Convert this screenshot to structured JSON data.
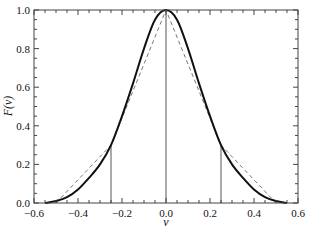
{
  "chart_data": {
    "type": "line",
    "title": "",
    "xlabel": "v",
    "ylabel": "F(v)",
    "xlim": [
      -0.6,
      0.6
    ],
    "ylim": [
      0.0,
      1.0
    ],
    "xticks": [
      -0.6,
      -0.4,
      -0.2,
      0.0,
      0.2,
      0.4,
      0.6
    ],
    "xtick_labels": [
      "−0.6",
      "−0.4",
      "−0.2",
      "0.0",
      "0.2",
      "0.4",
      "0.6"
    ],
    "yticks": [
      0.0,
      0.2,
      0.4,
      0.6,
      0.8,
      1.0
    ],
    "ytick_labels": [
      "0.0",
      "0.2",
      "0.4",
      "0.6",
      "0.8",
      "1.0"
    ],
    "grid": false,
    "legend": null,
    "series": [
      {
        "name": "smooth curve",
        "style": "solid",
        "color": "#111111",
        "x": [
          -0.55,
          -0.5,
          -0.45,
          -0.4,
          -0.35,
          -0.3,
          -0.25,
          -0.2,
          -0.15,
          -0.1,
          -0.05,
          0.0,
          0.05,
          0.1,
          0.15,
          0.2,
          0.25,
          0.3,
          0.35,
          0.4,
          0.45,
          0.5,
          0.55
        ],
        "values": [
          0.0,
          0.01,
          0.03,
          0.07,
          0.13,
          0.2,
          0.3,
          0.45,
          0.62,
          0.8,
          0.95,
          1.0,
          0.95,
          0.8,
          0.62,
          0.45,
          0.3,
          0.2,
          0.13,
          0.07,
          0.03,
          0.01,
          0.0
        ]
      },
      {
        "name": "piecewise linear",
        "style": "dashed",
        "color": "#777777",
        "x": [
          -0.5,
          -0.25,
          0.0,
          0.25,
          0.5
        ],
        "values": [
          0.0,
          0.3,
          1.0,
          0.3,
          0.0
        ]
      }
    ],
    "vertical_lines": [
      -0.25,
      0.0,
      0.25
    ]
  }
}
